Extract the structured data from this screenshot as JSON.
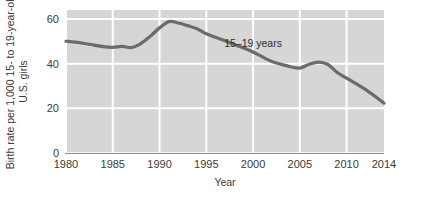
{
  "chart_data": {
    "type": "line",
    "title": "",
    "xlabel": "Year",
    "ylabel": "Birth rate per 1,000 15- to 19-year-old U.S. girls",
    "ylabel_line1": "Birth rate per 1,000 15- to 19-year-old",
    "ylabel_line2": "U.S. girls",
    "xlim": [
      1980,
      2014
    ],
    "ylim": [
      0,
      64
    ],
    "yticks": [
      0,
      20,
      40,
      60
    ],
    "ytick_labels": [
      "0",
      "20",
      "40",
      "60"
    ],
    "xticks": [
      1980,
      1985,
      1990,
      1995,
      2000,
      2005,
      2010,
      2014
    ],
    "xtick_labels": [
      "1980",
      "1985",
      "1990",
      "1995",
      "2000",
      "2005",
      "2010",
      "2014"
    ],
    "grid": true,
    "grid_color": "#ffffff",
    "plot_background": "#d6d6d6",
    "legend_position": "inline-annotation",
    "annotations": [
      {
        "text": "15–19 years",
        "x": 2000,
        "y": 47.5
      }
    ],
    "series": [
      {
        "name": "15–19 years",
        "color": "#6b6b6b",
        "line_width": 3.2,
        "x": [
          1980,
          1981,
          1982,
          1983,
          1984,
          1985,
          1986,
          1987,
          1988,
          1989,
          1990,
          1991,
          1992,
          1993,
          1994,
          1995,
          1996,
          1997,
          1998,
          1999,
          2000,
          2001,
          2002,
          2003,
          2004,
          2005,
          2006,
          2007,
          2008,
          2009,
          2010,
          2011,
          2012,
          2013,
          2014
        ],
        "values": [
          50.0,
          49.6,
          49.0,
          48.3,
          47.6,
          47.3,
          47.7,
          47.2,
          49.0,
          52.2,
          56.0,
          58.8,
          58.2,
          57.0,
          55.6,
          53.4,
          51.8,
          50.2,
          48.5,
          47.0,
          45.2,
          43.0,
          41.0,
          39.7,
          38.6,
          38.0,
          39.7,
          40.7,
          39.6,
          36.0,
          33.5,
          31.0,
          28.5,
          25.5,
          22.3
        ]
      }
    ]
  },
  "geometry": {
    "plot_left": 66,
    "plot_right": 384,
    "plot_top": 10,
    "plot_bottom": 153
  }
}
